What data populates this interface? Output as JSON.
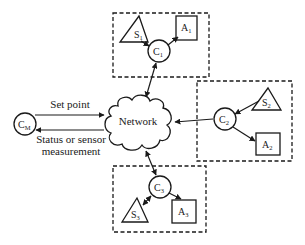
{
  "diagram": {
    "central_node": {
      "label": "Network",
      "icon": "cloud-icon"
    },
    "master_controller": {
      "label": "C",
      "subscript": "M"
    },
    "links": {
      "set_point": "Set point",
      "status_line1": "Status or sensor",
      "status_line2": "measurement"
    },
    "subsystems": [
      {
        "id": 1,
        "controller": {
          "label": "C",
          "subscript": "1"
        },
        "sensor": {
          "label": "S",
          "subscript": "1"
        },
        "actuator": {
          "label": "A",
          "subscript": "1"
        }
      },
      {
        "id": 2,
        "controller": {
          "label": "C",
          "subscript": "2"
        },
        "sensor": {
          "label": "S",
          "subscript": "2"
        },
        "actuator": {
          "label": "A",
          "subscript": "2"
        }
      },
      {
        "id": 3,
        "controller": {
          "label": "C",
          "subscript": "3"
        },
        "sensor": {
          "label": "S",
          "subscript": "3"
        },
        "actuator": {
          "label": "A",
          "subscript": "3"
        }
      }
    ],
    "colors": {
      "line": "#1a1a1a",
      "background": "#ffffff"
    }
  }
}
